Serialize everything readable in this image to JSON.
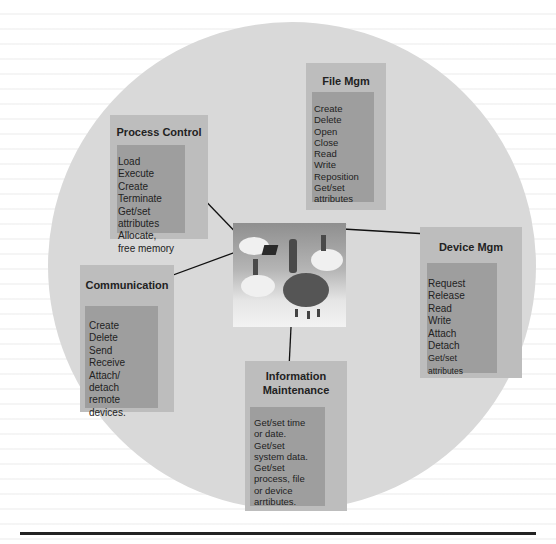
{
  "diagram": {
    "center": {
      "label": "",
      "icon": "people-on-clouds-illustration"
    },
    "nodes": [
      {
        "id": "process-control",
        "title": "Process Control",
        "items": [
          "Load",
          "Execute",
          "Create",
          "Terminate",
          "Get/set",
          "attributes",
          "Allocate,",
          "free memory"
        ]
      },
      {
        "id": "file-mgm",
        "title": "File Mgm",
        "items": [
          "Create",
          "Delete",
          "Open",
          "Close",
          "Read",
          "Write",
          "Reposition",
          "Get/set",
          "attributes"
        ]
      },
      {
        "id": "device-mgm",
        "title": "Device Mgm",
        "items": [
          "Request",
          "Release",
          "Read",
          "Write",
          "Attach",
          "Detach",
          "Get/set",
          "attributes"
        ]
      },
      {
        "id": "communication",
        "title": "Communication",
        "items": [
          "Create",
          "Delete",
          "Send",
          "Receive",
          "Attach/",
          "detach",
          "remote",
          "devices."
        ]
      },
      {
        "id": "information-maintenance",
        "title_lines": [
          "Information",
          "Maintenance"
        ],
        "items": [
          "Get/set time",
          "or date.",
          "Get/set",
          "system data.",
          "Get/set",
          "process, file",
          "or device",
          "arrtibutes."
        ]
      }
    ],
    "colors": {
      "circle": "#d9d9d9",
      "box_outer": "#bdbdbd",
      "box_inner": "#9e9e9e",
      "text": "#222222"
    }
  }
}
